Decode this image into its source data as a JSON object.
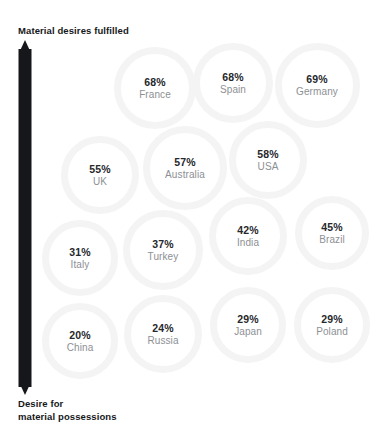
{
  "chart_data": {
    "type": "scatter",
    "title": "Material desires fulfilled",
    "xlabel": "",
    "ylabel": "Desire for material possessions",
    "ylabel_lines": [
      "Desire for",
      "material possessions"
    ],
    "grid": false,
    "legend": "none",
    "value_suffix": "%",
    "categories": [
      "France",
      "Spain",
      "Germany",
      "UK",
      "Australia",
      "USA",
      "Italy",
      "Turkey",
      "India",
      "Brazil",
      "China",
      "Russia",
      "Japan",
      "Poland"
    ],
    "values": [
      68,
      68,
      69,
      55,
      57,
      58,
      31,
      37,
      42,
      45,
      20,
      24,
      29,
      29
    ],
    "points": [
      {
        "label": "France",
        "value": "68%",
        "cx": 155,
        "cy": 88,
        "d": 82
      },
      {
        "label": "Spain",
        "value": "68%",
        "cx": 233,
        "cy": 83,
        "d": 80
      },
      {
        "label": "Germany",
        "value": "69%",
        "cx": 317,
        "cy": 85,
        "d": 85
      },
      {
        "label": "UK",
        "value": "55%",
        "cx": 100,
        "cy": 175,
        "d": 78
      },
      {
        "label": "Australia",
        "value": "57%",
        "cx": 185,
        "cy": 168,
        "d": 84
      },
      {
        "label": "USA",
        "value": "58%",
        "cx": 268,
        "cy": 160,
        "d": 78
      },
      {
        "label": "Italy",
        "value": "31%",
        "cx": 80,
        "cy": 258,
        "d": 76
      },
      {
        "label": "Turkey",
        "value": "37%",
        "cx": 163,
        "cy": 250,
        "d": 80
      },
      {
        "label": "India",
        "value": "42%",
        "cx": 248,
        "cy": 236,
        "d": 78
      },
      {
        "label": "Brazil",
        "value": "45%",
        "cx": 332,
        "cy": 233,
        "d": 74
      },
      {
        "label": "China",
        "value": "20%",
        "cx": 80,
        "cy": 341,
        "d": 76
      },
      {
        "label": "Russia",
        "value": "24%",
        "cx": 163,
        "cy": 334,
        "d": 78
      },
      {
        "label": "Japan",
        "value": "29%",
        "cx": 248,
        "cy": 325,
        "d": 76
      },
      {
        "label": "Poland",
        "value": "29%",
        "cx": 332,
        "cy": 325,
        "d": 76
      }
    ]
  },
  "axis": {
    "arrow_name": "vertical-double-arrow",
    "color": "#15171a"
  },
  "colors": {
    "background": "#ffffff",
    "bubble_ring": "#f4f4f4",
    "value_text": "#26282b",
    "label_text": "#8d9094",
    "title_text": "#16181a"
  }
}
